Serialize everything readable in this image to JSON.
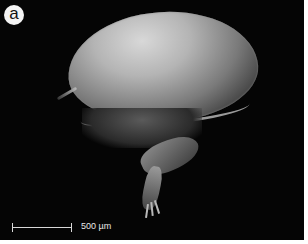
{
  "figure": {
    "panel_label": "a",
    "scale_bar": {
      "text": "500 µm"
    },
    "image_type": "scanning electron micrograph",
    "colors": {
      "background": "#050505",
      "label_circle": "#f4f4f4",
      "scale_bar": "#d8d8d8"
    }
  }
}
